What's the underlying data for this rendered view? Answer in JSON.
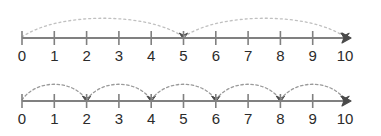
{
  "figure": {
    "title": "",
    "background_color": "#ffffff",
    "axis_color": "#808080",
    "tick_color": "#808080",
    "arc_color_top": "#c0c0c0",
    "arc_color_bottom": "#9a9a9a",
    "arrow_color": "#4a4a4a",
    "label_color": "#2b2b2b"
  },
  "chart_data": {
    "type": "line",
    "xlabel": "",
    "ylabel": "",
    "xlim": [
      0,
      10
    ],
    "grid": false,
    "legend": "none",
    "lines": [
      {
        "name": "top-number-line",
        "tick_values": [
          0,
          1,
          2,
          3,
          4,
          5,
          6,
          7,
          8,
          9,
          10
        ],
        "tick_labels": [
          "0",
          "1",
          "2",
          "3",
          "4",
          "5",
          "6",
          "7",
          "8",
          "9",
          "10"
        ],
        "jump_size": 5,
        "jump_count": 2,
        "jumps": [
          {
            "from": 0,
            "to": 5
          },
          {
            "from": 5,
            "to": 10
          }
        ],
        "end_arrow_at": 10
      },
      {
        "name": "bottom-number-line",
        "tick_values": [
          0,
          1,
          2,
          3,
          4,
          5,
          6,
          7,
          8,
          9,
          10
        ],
        "tick_labels": [
          "0",
          "1",
          "2",
          "3",
          "4",
          "5",
          "6",
          "7",
          "8",
          "9",
          "10"
        ],
        "jump_size": 2,
        "jump_count": 5,
        "jumps": [
          {
            "from": 0,
            "to": 2
          },
          {
            "from": 2,
            "to": 4
          },
          {
            "from": 4,
            "to": 6
          },
          {
            "from": 6,
            "to": 8
          },
          {
            "from": 8,
            "to": 10
          }
        ],
        "end_arrow_at": 10
      }
    ]
  },
  "geometry": {
    "origin_x": 22,
    "unit_px": 32.3,
    "top_axis_y": 38,
    "bottom_axis_y": 101,
    "tick_half": 7,
    "label_offset_y": 10
  }
}
